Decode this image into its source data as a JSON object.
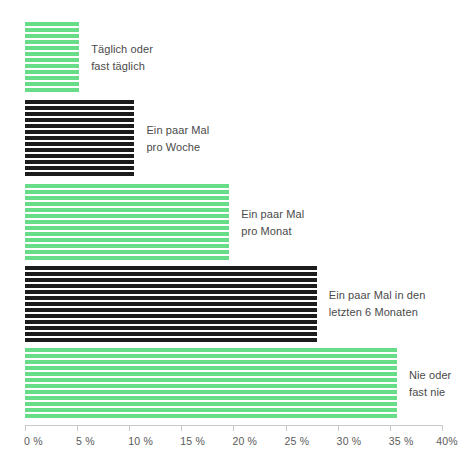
{
  "chart_data": {
    "type": "bar",
    "orientation": "horizontal",
    "title": "",
    "subtitle": "",
    "xlabel": "",
    "ylabel": "",
    "xlim": [
      0,
      40
    ],
    "grid": false,
    "legend": "none",
    "categories": [
      "Täglich oder\nfast täglich",
      "Ein paar Mal\npro Woche",
      "Ein paar Mal\npro Monat",
      "Ein paar Mal in den\nletzten 6 Monaten",
      "Nie oder\nfast nie"
    ],
    "values": [
      5.2,
      10.5,
      19.6,
      28.0,
      35.7
    ],
    "bar_colors": [
      "green",
      "black",
      "green",
      "black",
      "green"
    ],
    "tick_labels": [
      "0 %",
      "5 %",
      "10 %",
      "15 %",
      "20 %",
      "25 %",
      "30 %",
      "35 %",
      "40%"
    ],
    "tick_values": [
      0,
      5,
      10,
      15,
      20,
      25,
      30,
      35,
      40
    ]
  },
  "colors": {
    "green": "#68dd88",
    "black": "#1c1c1c",
    "axis": "#c8c8c8",
    "label_text": "#4a4a4a",
    "tick_text": "#5a5a5a",
    "background": "#ffffff"
  },
  "bars": [
    {
      "label": "Täglich oder\nfast täglich",
      "value": 5.2,
      "color": "green"
    },
    {
      "label": "Ein paar Mal\npro Woche",
      "value": 10.5,
      "color": "black"
    },
    {
      "label": "Ein paar Mal\npro Monat",
      "value": 19.6,
      "color": "green"
    },
    {
      "label": "Ein paar Mal in den\nletzten 6 Monaten",
      "value": 28.0,
      "color": "black"
    },
    {
      "label": "Nie oder\nfast nie",
      "value": 35.7,
      "color": "green"
    }
  ],
  "axis": {
    "ticks": [
      {
        "label": "0 %",
        "value": 0
      },
      {
        "label": "5 %",
        "value": 5
      },
      {
        "label": "10 %",
        "value": 10
      },
      {
        "label": "15 %",
        "value": 15
      },
      {
        "label": "20 %",
        "value": 20
      },
      {
        "label": "25 %",
        "value": 25
      },
      {
        "label": "30 %",
        "value": 30
      },
      {
        "label": "35 %",
        "value": 35
      },
      {
        "label": "40%",
        "value": 40
      }
    ]
  }
}
